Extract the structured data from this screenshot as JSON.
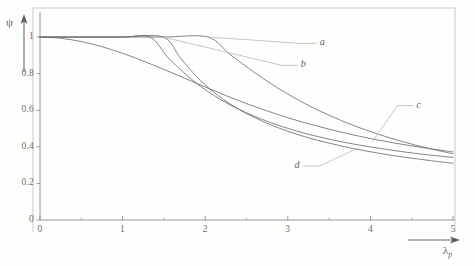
{
  "figure": {
    "background_color": "#fefefd",
    "frame_color": "#c9c9c9",
    "line_color": "#6f6f6f"
  },
  "axes": {
    "y_title": "ψ",
    "x_title": "λ",
    "x_title_sub": "p"
  },
  "chart_data": {
    "type": "line",
    "title": "",
    "xlabel": "λ_p",
    "ylabel": "ψ",
    "xlim": [
      0,
      5
    ],
    "ylim": [
      0,
      1.06
    ],
    "grid": false,
    "legend": "inline-labels",
    "x_ticks": [
      0,
      1,
      2,
      3,
      4,
      5
    ],
    "x_tick_labels": [
      "0",
      "1",
      "2",
      "3",
      "4",
      "5"
    ],
    "x_minor_ticks": [
      0.5,
      1.5,
      2.5,
      3.5,
      4.5
    ],
    "y_ticks": [
      0,
      0.2,
      0.4,
      0.6,
      0.8,
      1
    ],
    "y_tick_labels": [
      "0",
      "0.2",
      "0.4",
      "0.6",
      "0.8",
      "1"
    ],
    "annotations": [
      {
        "text": "a",
        "x": 3.35,
        "y": 0.965,
        "leader_to": {
          "x": 2.03,
          "y": 1.0
        }
      },
      {
        "text": "b",
        "x": 3.12,
        "y": 0.845,
        "leader_to": {
          "x": 1.49,
          "y": 1.0
        }
      },
      {
        "text": "c",
        "x": 4.52,
        "y": 0.625,
        "leader_to": {
          "x": 4.02,
          "y": 0.425
        }
      },
      {
        "text": "d",
        "x": 3.19,
        "y": 0.295,
        "leader_to": {
          "x": 3.86,
          "y": 0.395
        }
      }
    ],
    "series": [
      {
        "name": "a",
        "points": [
          [
            0.0,
            1.0
          ],
          [
            0.5,
            1.0
          ],
          [
            1.0,
            1.0
          ],
          [
            1.5,
            1.0
          ],
          [
            2.03,
            1.0
          ],
          [
            2.3,
            0.905
          ],
          [
            2.6,
            0.805
          ],
          [
            2.9,
            0.715
          ],
          [
            3.2,
            0.638
          ],
          [
            3.5,
            0.572
          ],
          [
            3.8,
            0.516
          ],
          [
            4.1,
            0.468
          ],
          [
            4.4,
            0.427
          ],
          [
            4.7,
            0.392
          ],
          [
            5.0,
            0.362
          ]
        ]
      },
      {
        "name": "b",
        "points": [
          [
            0.0,
            1.0
          ],
          [
            0.5,
            1.0
          ],
          [
            1.0,
            1.0
          ],
          [
            1.49,
            1.0
          ],
          [
            1.7,
            0.885
          ],
          [
            1.9,
            0.782
          ],
          [
            2.1,
            0.7
          ],
          [
            2.35,
            0.62
          ],
          [
            2.6,
            0.559
          ],
          [
            2.9,
            0.501
          ],
          [
            3.2,
            0.456
          ],
          [
            3.5,
            0.42
          ],
          [
            3.8,
            0.39
          ],
          [
            4.1,
            0.365
          ],
          [
            4.4,
            0.344
          ],
          [
            4.7,
            0.326
          ],
          [
            5.0,
            0.31
          ]
        ]
      },
      {
        "name": "c",
        "points": [
          [
            0.0,
            1.0
          ],
          [
            0.5,
            1.0
          ],
          [
            1.0,
            1.0
          ],
          [
            1.33,
            1.0
          ],
          [
            1.55,
            0.888
          ],
          [
            1.78,
            0.79
          ],
          [
            2.0,
            0.712
          ],
          [
            2.25,
            0.642
          ],
          [
            2.5,
            0.586
          ],
          [
            2.8,
            0.531
          ],
          [
            3.1,
            0.487
          ],
          [
            3.4,
            0.452
          ],
          [
            3.7,
            0.423
          ],
          [
            4.0,
            0.399
          ],
          [
            4.3,
            0.379
          ],
          [
            4.6,
            0.361
          ],
          [
            5.0,
            0.342
          ]
        ]
      },
      {
        "name": "d",
        "points": [
          [
            0.0,
            1.0
          ],
          [
            0.25,
            0.993
          ],
          [
            0.5,
            0.975
          ],
          [
            0.75,
            0.947
          ],
          [
            1.0,
            0.911
          ],
          [
            1.25,
            0.869
          ],
          [
            1.5,
            0.823
          ],
          [
            1.75,
            0.775
          ],
          [
            2.0,
            0.727
          ],
          [
            2.25,
            0.68
          ],
          [
            2.5,
            0.636
          ],
          [
            2.75,
            0.596
          ],
          [
            3.0,
            0.559
          ],
          [
            3.25,
            0.526
          ],
          [
            3.5,
            0.496
          ],
          [
            3.75,
            0.469
          ],
          [
            4.0,
            0.445
          ],
          [
            4.25,
            0.424
          ],
          [
            4.5,
            0.405
          ],
          [
            4.75,
            0.388
          ],
          [
            5.0,
            0.372
          ]
        ]
      }
    ]
  }
}
